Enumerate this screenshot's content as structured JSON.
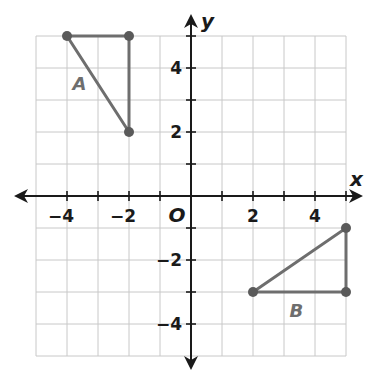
{
  "chart_data": {
    "type": "coordinate-plane",
    "title": "",
    "xlabel": "x",
    "ylabel": "y",
    "xlim": [
      -5,
      5
    ],
    "ylim": [
      -5,
      5
    ],
    "grid": true,
    "origin_label": "O",
    "x_tick_labels": [
      {
        "value": -4,
        "label": "−4"
      },
      {
        "value": -2,
        "label": "−2"
      },
      {
        "value": 2,
        "label": "2"
      },
      {
        "value": 4,
        "label": "4"
      }
    ],
    "y_tick_labels": [
      {
        "value": 4,
        "label": "4"
      },
      {
        "value": 2,
        "label": "2"
      },
      {
        "value": -2,
        "label": "−2"
      },
      {
        "value": -4,
        "label": "−4"
      }
    ],
    "shapes": [
      {
        "name": "A",
        "type": "triangle",
        "vertices": [
          [
            -4,
            5
          ],
          [
            -2,
            5
          ],
          [
            -2,
            2
          ]
        ],
        "label_position": [
          -3.6,
          3.5
        ]
      },
      {
        "name": "B",
        "type": "triangle",
        "vertices": [
          [
            2,
            -3
          ],
          [
            5,
            -3
          ],
          [
            5,
            -1
          ]
        ],
        "label_position": [
          3.4,
          -3.6
        ]
      }
    ]
  },
  "colors": {
    "grid": "#c8c8c8",
    "axis": "#1a1a1a",
    "shape": "#6e6e6e",
    "vertex": "#5a5a5a"
  }
}
